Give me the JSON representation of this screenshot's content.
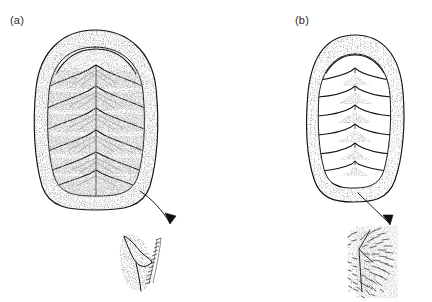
{
  "figure": {
    "background_color": "#ffffff",
    "ink_color": "#111111",
    "stipple_color": "#6b6b6b",
    "width": 432,
    "height": 302,
    "style": "pen-and-ink stipple line drawing"
  },
  "panels": [
    {
      "id": "a",
      "label": "(a)",
      "subject": "chiton-dorsal-view",
      "valve_count": 8,
      "girdle_type": "smooth naked girdle",
      "valve_sculpture": "strong V-shaped (chevron) lateral ridges",
      "body_outline": "broad oval",
      "inset": {
        "name": "girdle-margin-detail-a",
        "description": "magnified girdle edge with a single row of fine marginal bristles",
        "ornament": "fine marginal bristles"
      },
      "arrow": {
        "name": "detail-arrow-a",
        "style": "curved",
        "direction": "down-right"
      }
    },
    {
      "id": "b",
      "label": "(b)",
      "subject": "chiton-dorsal-view",
      "valve_count": 8,
      "girdle_type": "broad stippled spiculose girdle",
      "valve_sculpture": "faint chevron shading, smooth valves",
      "body_outline": "narrow oval",
      "inset": {
        "name": "girdle-margin-detail-b",
        "description": "magnified girdle edge densely covered with elongate club-shaped spicules",
        "ornament": "dense elongate spicules"
      },
      "arrow": {
        "name": "detail-arrow-b",
        "style": "straight",
        "direction": "down-right"
      }
    }
  ]
}
